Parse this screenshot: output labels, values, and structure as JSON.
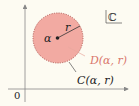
{
  "diagram": {
    "plane_symbol": "ℂ",
    "origin_label": "0",
    "center_label": "α",
    "radius_label": "r",
    "disk_label": "D(α, r)",
    "circle_label": "C(α, r)",
    "colors": {
      "background": "#fdfbf2",
      "disk_fill": "#f2aaa2",
      "disk_border": "#c0605a",
      "disk_label": "#d9766c",
      "axis": "#777777",
      "text": "#222222"
    }
  }
}
